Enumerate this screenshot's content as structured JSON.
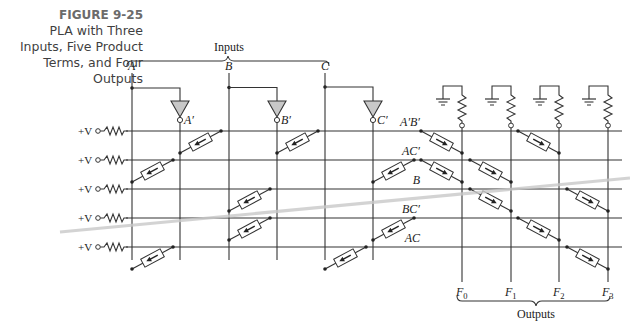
{
  "caption": {
    "figure": "FIGURE 9-25",
    "lines": [
      "PLA with Three",
      "Inputs, Five Product",
      "Terms, and Four",
      "Outputs"
    ]
  },
  "inputs_label": "Inputs",
  "outputs_label": "Outputs",
  "supply_label": "+V",
  "input_columns": [
    {
      "name": "A",
      "x": 132
    },
    {
      "name": "A'",
      "x": 180
    },
    {
      "name": "B",
      "x": 229
    },
    {
      "name": "B'",
      "x": 277
    },
    {
      "name": "C",
      "x": 325
    },
    {
      "name": "C'",
      "x": 373
    }
  ],
  "inputs": [
    {
      "label": "A",
      "x": 132,
      "inv_x": 180,
      "inv_label": "A′"
    },
    {
      "label": "B",
      "x": 229,
      "inv_x": 277,
      "inv_label": "B′"
    },
    {
      "label": "C",
      "x": 325,
      "inv_x": 373,
      "inv_label": "C′"
    }
  ],
  "product_terms": [
    {
      "label": "A′B′",
      "y": 131,
      "inputs": [
        "A'",
        "B'"
      ],
      "outputs": [
        0,
        2
      ]
    },
    {
      "label": "AC′",
      "y": 160,
      "inputs": [
        "A",
        "C'"
      ],
      "outputs": [
        0,
        1
      ]
    },
    {
      "label": "B",
      "y": 189,
      "inputs": [
        "B"
      ],
      "outputs": [
        1,
        3
      ]
    },
    {
      "label": "BC′",
      "y": 218,
      "inputs": [
        "B",
        "C'"
      ],
      "outputs": [
        2
      ]
    },
    {
      "label": "AC",
      "y": 247,
      "inputs": [
        "A",
        "C"
      ],
      "outputs": [
        3
      ]
    }
  ],
  "outputs": [
    {
      "label": "F",
      "sub": "0",
      "x": 462
    },
    {
      "label": "F",
      "sub": "1",
      "x": 511
    },
    {
      "label": "F",
      "sub": "2",
      "x": 559
    },
    {
      "label": "F",
      "sub": "3",
      "x": 608
    }
  ]
}
